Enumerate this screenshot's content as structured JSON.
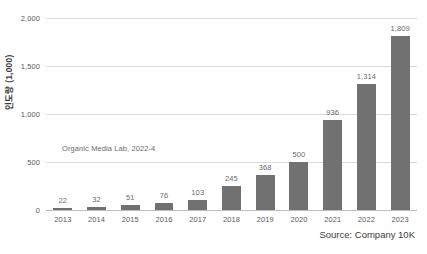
{
  "chart_data": {
    "type": "bar",
    "title": "",
    "subtitle": "",
    "xlabel": "",
    "ylabel": "인도량 (1,000)",
    "categories": [
      "2013",
      "2014",
      "2015",
      "2016",
      "2017",
      "2018",
      "2019",
      "2020",
      "2021",
      "2022",
      "2023"
    ],
    "values": [
      22,
      32,
      51,
      76,
      103,
      245,
      368,
      500,
      936,
      1314,
      1809
    ],
    "value_labels": [
      "22",
      "32",
      "51",
      "76",
      "103",
      "245",
      "368",
      "500",
      "936",
      "1,314",
      "1,809"
    ],
    "ylim": [
      0,
      2000
    ],
    "yticks": [
      0,
      500,
      1000,
      1500,
      2000
    ],
    "ytick_labels": [
      "0",
      "500",
      "1,000",
      "1,500",
      "2,000"
    ],
    "grid": true,
    "legend": "none",
    "series_color": "#717171",
    "annotation": "Organic Media Lab, 2022-4",
    "source": "Source: Company 10K"
  },
  "colors": {
    "bar": "#717171",
    "gridline": "#d9d9d9",
    "baseline": "#bdbdbd",
    "tick_text": "#5a5a5a",
    "label_text": "#6b6b6b",
    "axis_title": "#3d3d3d",
    "background": "#ffffff"
  }
}
